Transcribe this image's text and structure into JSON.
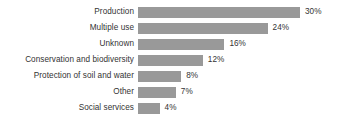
{
  "chart_data": {
    "type": "bar",
    "orientation": "horizontal",
    "title": "",
    "subtitle": "",
    "xlabel": "",
    "ylabel": "",
    "grid": false,
    "legend": false,
    "axis_visible": false,
    "xlim": [
      0,
      30
    ],
    "value_suffix": "%",
    "categories": [
      "Production",
      "Multiple use",
      "Unknown",
      "Conservation and biodiversity",
      "Protection of soil and water",
      "Other",
      "Social services"
    ],
    "values": [
      30,
      24,
      16,
      12,
      8,
      7,
      4
    ],
    "value_labels": [
      "30%",
      "24%",
      "16%",
      "12%",
      "8%",
      "7%",
      "4%"
    ],
    "bars": [
      {
        "category": "Production",
        "value": 30,
        "value_label": "30%"
      },
      {
        "category": "Multiple use",
        "value": 24,
        "value_label": "24%"
      },
      {
        "category": "Unknown",
        "value": 16,
        "value_label": "16%"
      },
      {
        "category": "Conservation and biodiversity",
        "value": 12,
        "value_label": "12%"
      },
      {
        "category": "Protection of soil and water",
        "value": 8,
        "value_label": "8%"
      },
      {
        "category": "Other",
        "value": 7,
        "value_label": "7%"
      },
      {
        "category": "Social services",
        "value": 4,
        "value_label": "4%"
      }
    ],
    "colors": {
      "bar": "#999999",
      "text": "#333333",
      "background": "#ffffff"
    },
    "scale_px_per_unit": 5.4
  }
}
